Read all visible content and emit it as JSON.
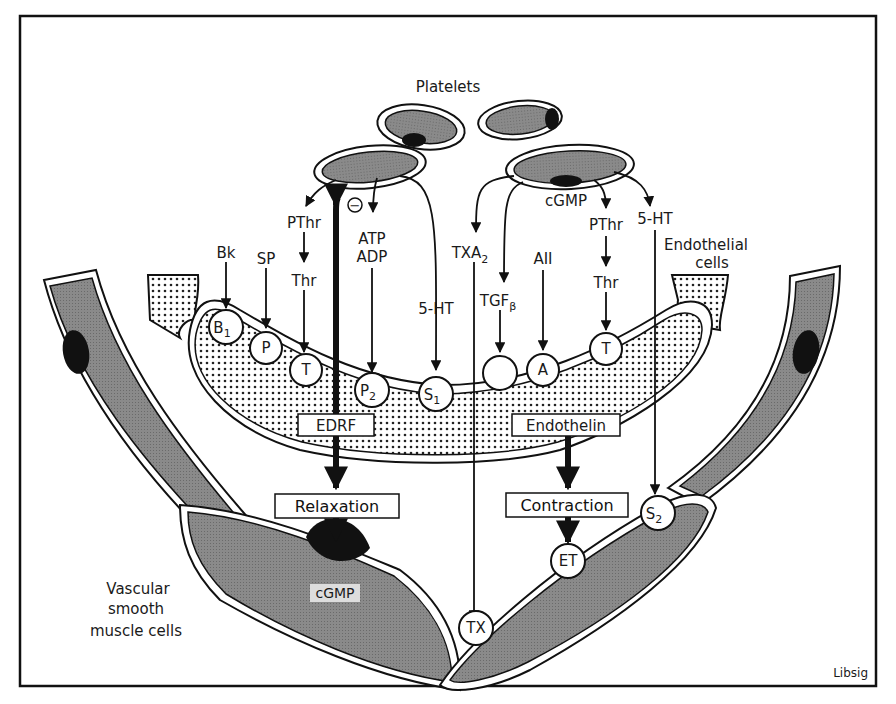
{
  "title": "Platelets",
  "labels": {
    "platelets": "Platelets",
    "endothelial_cells_line1": "Endothelial",
    "endothelial_cells_line2": "cells",
    "vsmc_line1": "Vascular",
    "vsmc_line2": "smooth",
    "vsmc_line3": "muscle cells",
    "credit": "Libsig"
  },
  "mediators": {
    "bk": "Bk",
    "sp": "SP",
    "pthr_left": "PThr",
    "thr_left": "Thr",
    "atp": "ATP",
    "adp": "ADP",
    "inhibit": "−",
    "ht5_left": "5-HT",
    "txa": "TXA",
    "txa_sub": "2",
    "tgf": "TGF",
    "tgf_sub": "β",
    "aii": "AII",
    "cgmp_platelet": "cGMP",
    "pthr_right": "PThr",
    "thr_right": "Thr",
    "ht5_right": "5-HT"
  },
  "receptors": {
    "b1": "B",
    "b1_sub": "1",
    "p": "P",
    "t_left": "T",
    "p2": "P",
    "p2_sub": "2",
    "s1": "S",
    "s1_sub": "1",
    "tgf_receptor": "",
    "a": "A",
    "t_right": "T",
    "s2": "S",
    "s2_sub": "2",
    "et": "ET",
    "tx": "TX"
  },
  "boxes": {
    "edrf": "EDRF",
    "endothelin": "Endothelin",
    "relaxation": "Relaxation",
    "contraction": "Contraction",
    "cgmp_smooth": "cGMP"
  }
}
